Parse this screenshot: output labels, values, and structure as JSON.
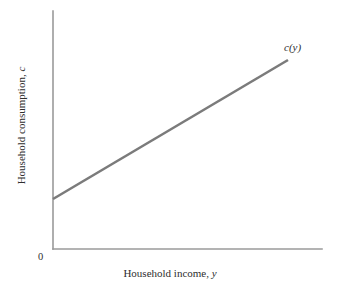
{
  "chart_data": {
    "type": "line",
    "title": "",
    "subtitle": "",
    "xlabel_text": "Household income,",
    "xlabel_var": "y",
    "ylabel_text": "Household consumption,",
    "ylabel_var": "c",
    "origin_label": "0",
    "grid": false,
    "legend_position": "inline-end-of-line",
    "xlim": [
      0,
      1
    ],
    "ylim": [
      0,
      1
    ],
    "axis_ticks": [],
    "series": [
      {
        "name": "c(y)",
        "label_text": "c",
        "label_var": "y",
        "label_open_paren": "(",
        "label_close_paren": ")",
        "color": "#7b7b7b",
        "x": [
          0.0,
          1.0
        ],
        "y": [
          0.21,
          0.79
        ],
        "description": "Consumption function: linear, positive intercept, slope less than one (marginal propensity to consume)",
        "intercept": 0.21,
        "slope": 0.58
      }
    ],
    "axis_color": "#9a9a9a",
    "background_color": "#ffffff"
  },
  "geometry": {
    "axis_x": 53,
    "axis_y": 249,
    "axis_top": 11,
    "axis_right": 322,
    "line_x1": 53,
    "line_y1": 199,
    "line_x2": 288,
    "line_y2": 60
  }
}
